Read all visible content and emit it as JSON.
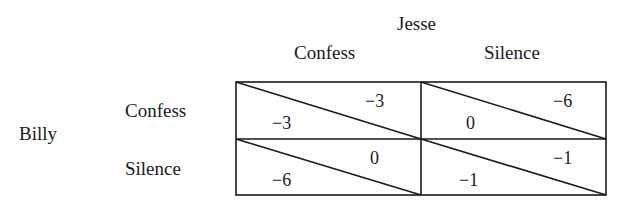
{
  "column_player": "Jesse",
  "row_player": "Billy",
  "columns": [
    "Confess",
    "Silence"
  ],
  "rows": [
    "Confess",
    "Silence"
  ],
  "cells": [
    [
      {
        "row_payoff": "−3",
        "col_payoff": "−3"
      },
      {
        "row_payoff": "0",
        "col_payoff": "−6"
      }
    ],
    [
      {
        "row_payoff": "−6",
        "col_payoff": "0"
      },
      {
        "row_payoff": "−1",
        "col_payoff": "−1"
      }
    ]
  ],
  "colors": {
    "line": "#1a1a1a",
    "text": "#1a1a1a",
    "background": "#ffffff"
  }
}
